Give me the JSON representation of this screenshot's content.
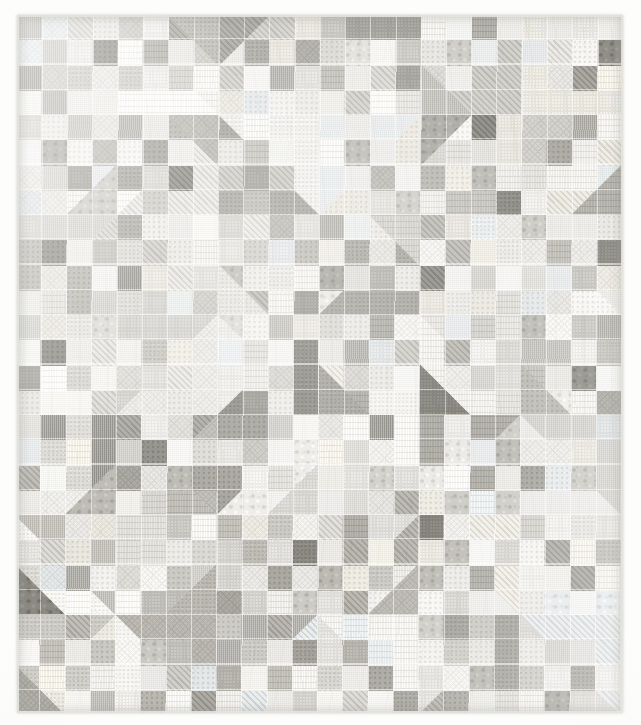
{
  "image": {
    "subject": "patchwork quilt",
    "description": "Photograph of a low-volume scrappy patchwork quilt laid flat",
    "background_color": "#fdfdfc",
    "width": 641,
    "height": 725
  },
  "quilt": {
    "title": "Low Volume Scrappy Quilt",
    "bounds": {
      "left": 17,
      "top": 15,
      "width": 606,
      "height": 698
    },
    "layout": {
      "block_columns": 6,
      "block_rows": 7,
      "block_width": 101,
      "block_height": 100,
      "patch_grid": 4,
      "patch_size": 25,
      "block_style": "corner half-square triangles with four-patch checkerboard center"
    },
    "binding_color": "#e8e8e3",
    "background_fabric_color": "#f4f3f0",
    "quilting": {
      "visible": true,
      "style": "allover curved crosshatch arcs",
      "thread_color": "#d8d8d2"
    },
    "palette": {
      "lightest": "#f6f5f2",
      "light": "#eceae6",
      "mid_light": "#dedcd7",
      "mid": "#cfcdc7",
      "mid_dark": "#bcbab3",
      "dark": "#a9a7a0",
      "darkest": "#8e8c85",
      "warm_tint": "#efece4",
      "cool_tint": "#e8ebec"
    },
    "fabric_prints": [
      "solid",
      "dots",
      "diagonal-stripe",
      "crosshatch",
      "floral",
      "speckle",
      "tiny-check",
      "text-print"
    ]
  }
}
